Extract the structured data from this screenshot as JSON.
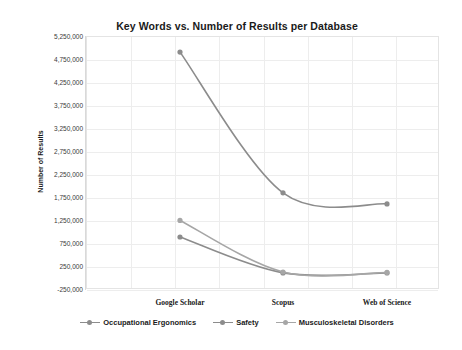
{
  "chart_data": {
    "type": "line",
    "title": "Key Words vs. Number of Results per Database",
    "xlabel": "",
    "ylabel": "Number of Results",
    "categories": [
      "Google Scholar",
      "Scopus",
      "Web of Science"
    ],
    "ylim": [
      -250000,
      5250000
    ],
    "ytick_labels": [
      "5,250,000",
      "4,750,000",
      "4,250,000",
      "3,750,000",
      "3,250,000",
      "2,750,000",
      "2,250,000",
      "1,750,000",
      "1,250,000",
      "750,000",
      "250,000",
      "-250,000"
    ],
    "ytick_values": [
      5250000,
      4750000,
      4250000,
      3750000,
      3250000,
      2750000,
      2250000,
      1750000,
      1250000,
      750000,
      250000,
      -250000
    ],
    "grid": true,
    "legend_position": "bottom",
    "series": [
      {
        "name": "Occupational Ergonomics",
        "color": "#8c8c8c",
        "values": [
          4900000,
          1840000,
          1600000
        ]
      },
      {
        "name": "Safety",
        "color": "#8c8c8c",
        "values": [
          880000,
          100000,
          100000
        ]
      },
      {
        "name": "Musculoskeletal Disorders",
        "color": "#a6a6a6",
        "values": [
          1240000,
          120000,
          110000
        ]
      }
    ]
  },
  "colors": {
    "grid": "#ededed",
    "frame": "#e4e4e4",
    "text": "#1a1a1a",
    "tick_text": "#3a3a3a",
    "series_1": "#8c8c8c",
    "series_2": "#8c8c8c",
    "series_3": "#a6a6a6"
  }
}
